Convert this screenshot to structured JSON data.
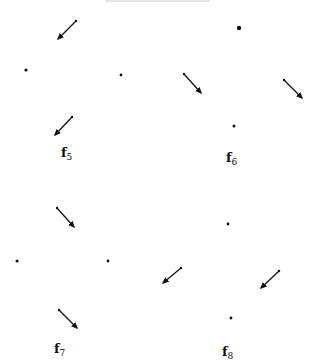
{
  "panels": [
    {
      "label": "f",
      "subscript": "5",
      "label_pos": [
        61,
        146
      ],
      "dots": [
        {
          "x": 26,
          "y": 70,
          "r": 1.6
        },
        {
          "x": 121,
          "y": 75,
          "r": 1.4
        }
      ],
      "arrows": [
        {
          "x1": 76,
          "y1": 21,
          "x2": 58,
          "y2": 39
        },
        {
          "x1": 72,
          "y1": 117,
          "x2": 55,
          "y2": 135
        }
      ]
    },
    {
      "label": "f",
      "subscript": "6",
      "label_pos": [
        226,
        151
      ],
      "dots": [
        {
          "x": 239,
          "y": 28,
          "r": 2.2
        },
        {
          "x": 234,
          "y": 126,
          "r": 1.5
        }
      ],
      "arrows": [
        {
          "x1": 184,
          "y1": 74,
          "x2": 201,
          "y2": 93
        },
        {
          "x1": 284,
          "y1": 80,
          "x2": 302,
          "y2": 98
        }
      ]
    },
    {
      "label": "f",
      "subscript": "7",
      "label_pos": [
        54,
        342
      ],
      "dots": [
        {
          "x": 17,
          "y": 261,
          "r": 1.5
        },
        {
          "x": 108,
          "y": 261,
          "r": 1.4
        }
      ],
      "arrows": [
        {
          "x1": 57,
          "y1": 208,
          "x2": 74,
          "y2": 227
        },
        {
          "x1": 59,
          "y1": 310,
          "x2": 77,
          "y2": 328
        }
      ]
    },
    {
      "label": "f",
      "subscript": "8",
      "label_pos": [
        222,
        345
      ],
      "dots": [
        {
          "x": 228,
          "y": 224,
          "r": 1.4
        },
        {
          "x": 231,
          "y": 318,
          "r": 1.4
        }
      ],
      "arrows": [
        {
          "x1": 181,
          "y1": 268,
          "x2": 163,
          "y2": 283
        },
        {
          "x1": 279,
          "y1": 271,
          "x2": 261,
          "y2": 288
        }
      ]
    }
  ],
  "colors": {
    "ink": "#111111",
    "background": "#ffffff"
  }
}
